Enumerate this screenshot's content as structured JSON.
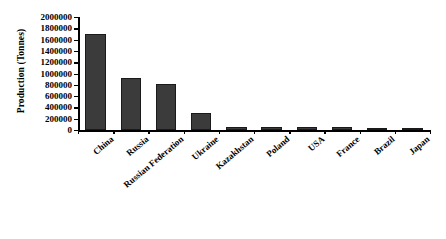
{
  "chart_data": {
    "type": "bar",
    "title": "",
    "xlabel": "",
    "ylabel": "Production (Tonnes)",
    "ylim": [
      0,
      2000000
    ],
    "ytick_step": 200000,
    "grid": false,
    "legend": null,
    "bar_color": "#3b3b3b",
    "bar_edge_color": "#1a1a1a",
    "categories": [
      "China",
      "Russia",
      "Russian Federation",
      "Ukraine",
      "Kazakhstan",
      "Poland",
      "USA",
      "France",
      "Brazil",
      "Japan"
    ],
    "values": [
      1700000,
      920000,
      810000,
      300000,
      55000,
      45000,
      50000,
      45000,
      30000,
      15000
    ],
    "ytick_labels": [
      "0",
      "200000",
      "400000",
      "600000",
      "800000",
      "1000000",
      "1200000",
      "1400000",
      "1600000",
      "1800000",
      "2000000"
    ],
    "ytick_values": [
      0,
      200000,
      400000,
      600000,
      800000,
      1000000,
      1200000,
      1400000,
      1600000,
      1800000,
      2000000
    ]
  }
}
